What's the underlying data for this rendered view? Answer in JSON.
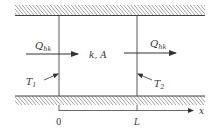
{
  "diagram": {
    "type": "heat-conduction-slab",
    "labels": {
      "heat_in": {
        "main": "Q",
        "sub": "hk"
      },
      "heat_out": {
        "main": "Q",
        "sub": "hk"
      },
      "properties": "k, A",
      "temp_left": {
        "main": "T",
        "sub": "1"
      },
      "temp_right": {
        "main": "T",
        "sub": "2"
      },
      "axis_label": "x",
      "tick_origin": "0",
      "tick_length": "L"
    },
    "colors": {
      "line": "#444444",
      "hatch": "#555555",
      "text": "#333333"
    }
  }
}
